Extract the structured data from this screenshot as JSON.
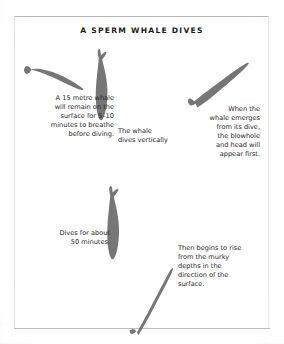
{
  "figure": {
    "title": "A SPERM WHALE DIVES",
    "ink_color": "#767676",
    "text_color": "#262626",
    "background_color": "#ffffff",
    "frame_color": "#b9b9b9"
  },
  "captions": {
    "surface": "A 15 metre whale\nwill remain on the\nsurface for 5–10\nminutes to breathe\nbefore diving.",
    "vertical": "The whale\ndives vertically",
    "emerge": "When the\nwhale emerges\nfrom its dive,\nthe blowhole\nand head will\nappear first.",
    "duration": "Dives for about\n50 minutes.",
    "rise": "Then begins to rise\nfrom the murky\ndepths in the\ndirection of the\nsurface."
  },
  "whales": [
    {
      "name": "whale-surface",
      "pose": "horizontal-at-surface"
    },
    {
      "name": "whale-diving",
      "pose": "vertical-head-down"
    },
    {
      "name": "whale-emerging",
      "pose": "tilted-head-up-right"
    },
    {
      "name": "whale-deep-dive",
      "pose": "vertical-head-down"
    },
    {
      "name": "whale-rising",
      "pose": "tilted-head-up-right"
    }
  ]
}
